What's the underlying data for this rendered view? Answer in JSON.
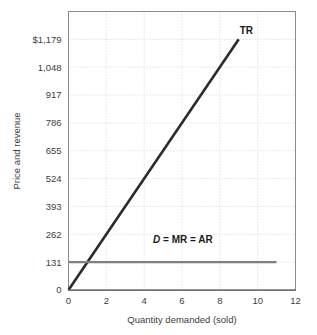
{
  "chart_data": {
    "type": "line",
    "title": "",
    "xlabel": "Quantity demanded (sold)",
    "ylabel": "Price and revenue",
    "xlim": [
      0,
      12
    ],
    "ylim": [
      0,
      1310
    ],
    "grid": true,
    "legend_position": "inline-annotation",
    "x_ticks": [
      "0",
      "2",
      "4",
      "6",
      "8",
      "10",
      "12"
    ],
    "x_tick_values": [
      0,
      2,
      4,
      6,
      8,
      10,
      12
    ],
    "y_ticks": [
      "0",
      "131",
      "262",
      "393",
      "524",
      "655",
      "786",
      "917",
      "1,048",
      "$1,179"
    ],
    "y_tick_values": [
      0,
      131,
      262,
      393,
      524,
      655,
      786,
      917,
      1048,
      1179
    ],
    "series": [
      {
        "name": "TR",
        "label": "TR",
        "type": "line",
        "color": "#2b2b2b",
        "width": 2.6,
        "x": [
          0,
          9
        ],
        "values": [
          0,
          1179
        ],
        "label_x": 9.05,
        "label_y": 1205
      },
      {
        "name": "D = MR = AR",
        "label_italic_part": "D",
        "label_rest": " = MR = AR",
        "type": "line",
        "color": "#808080",
        "width": 2.4,
        "x": [
          0,
          11
        ],
        "values": [
          131,
          131
        ],
        "label_x": 6.05,
        "label_y": 222
      }
    ],
    "annotations": [
      {
        "text": "TR",
        "x": 9.05,
        "y": 1205
      },
      {
        "text": "D = MR = AR",
        "x": 6.05,
        "y": 222
      }
    ]
  },
  "colors": {
    "tr_line": "#2b2b2b",
    "d_line": "#808080",
    "gridline": "#c8c8c8",
    "frame": "#8a8a8a",
    "axis": "#6e6e6e",
    "text": "#3d3d3d",
    "background": "#ffffff"
  }
}
